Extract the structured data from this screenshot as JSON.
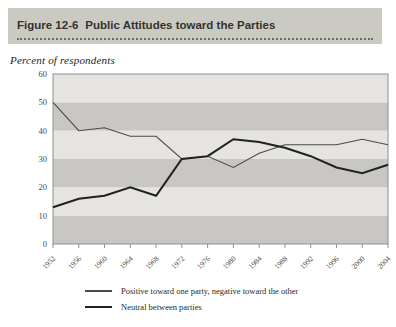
{
  "figure": {
    "label": "Figure 12-6",
    "title": "Public Attitudes toward the Parties",
    "y_axis_caption": "Percent of respondents"
  },
  "chart_data": {
    "type": "line",
    "x": [
      1952,
      1956,
      1960,
      1964,
      1968,
      1972,
      1976,
      1980,
      1984,
      1988,
      1992,
      1996,
      2000,
      2004
    ],
    "series": [
      {
        "name": "Positive toward one party, negative toward the other",
        "values": [
          50,
          40,
          41,
          38,
          38,
          30,
          31,
          27,
          32,
          35,
          35,
          35,
          37,
          35
        ],
        "color": "#4a4a46",
        "width": 1.1
      },
      {
        "name": "Neutral between parties",
        "values": [
          13,
          16,
          17,
          20,
          17,
          30,
          31,
          37,
          36,
          34,
          31,
          27,
          25,
          28
        ],
        "color": "#21211e",
        "width": 2
      }
    ],
    "title": "Public Attitudes toward the Parties",
    "ylabel": "Percent of respondents",
    "xlabel": "",
    "ylim": [
      0,
      60
    ],
    "ytick_step": 10,
    "xtick_labels": [
      "1952",
      "1956",
      "1960",
      "1964",
      "1968",
      "1972",
      "1976",
      "1980",
      "1984",
      "1988",
      "1992",
      "1996",
      "2000",
      "2004"
    ],
    "grid": "alternating horizontal bands",
    "band_colors": {
      "dark": "#c8c7c3",
      "light": "#e5e4e0"
    },
    "frame_color": "#8f8f8b",
    "legend_position": "bottom-left"
  },
  "colors": {
    "header_bg": "#cbcac2",
    "header_text": "#33322e",
    "axis_text": "#4a4a46",
    "page_bg": "#ffffff"
  }
}
